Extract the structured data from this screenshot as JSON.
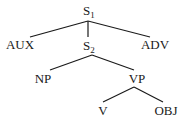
{
  "diagram": {
    "type": "syntax-tree",
    "nodes": {
      "s1": {
        "label": "S",
        "subscript": "1"
      },
      "aux": {
        "label": "AUX"
      },
      "s2": {
        "label": "S",
        "subscript": "2"
      },
      "adv": {
        "label": "ADV"
      },
      "np": {
        "label": "NP"
      },
      "vp": {
        "label": "VP"
      },
      "v": {
        "label": "V"
      },
      "obj": {
        "label": "OBJ"
      }
    },
    "edges": [
      {
        "from": "S1",
        "to": "AUX"
      },
      {
        "from": "S1",
        "to": "S2"
      },
      {
        "from": "S1",
        "to": "ADV"
      },
      {
        "from": "S2",
        "to": "NP"
      },
      {
        "from": "S2",
        "to": "VP"
      },
      {
        "from": "VP",
        "to": "V"
      },
      {
        "from": "VP",
        "to": "OBJ"
      }
    ]
  }
}
